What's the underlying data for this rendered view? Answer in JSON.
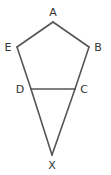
{
  "diagram": {
    "type": "geometry-figure",
    "stroke_color": "#555555",
    "label_color": "#333333",
    "points": {
      "A": {
        "label": "A",
        "x": 53,
        "y": 22,
        "label_x": 53,
        "label_y": 16
      },
      "B": {
        "label": "B",
        "x": 89,
        "y": 47,
        "label_x": 98,
        "label_y": 51
      },
      "C": {
        "label": "C",
        "x": 75,
        "y": 89,
        "label_x": 84,
        "label_y": 93
      },
      "D": {
        "label": "D",
        "x": 31,
        "y": 89,
        "label_x": 20,
        "label_y": 93
      },
      "E": {
        "label": "E",
        "x": 17,
        "y": 47,
        "label_x": 8,
        "label_y": 51
      },
      "X": {
        "label": "X",
        "x": 52,
        "y": 155,
        "label_x": 52,
        "label_y": 169
      }
    },
    "segments": [
      [
        "A",
        "B"
      ],
      [
        "B",
        "C"
      ],
      [
        "C",
        "D"
      ],
      [
        "D",
        "E"
      ],
      [
        "E",
        "A"
      ],
      [
        "D",
        "X"
      ],
      [
        "C",
        "X"
      ]
    ]
  }
}
